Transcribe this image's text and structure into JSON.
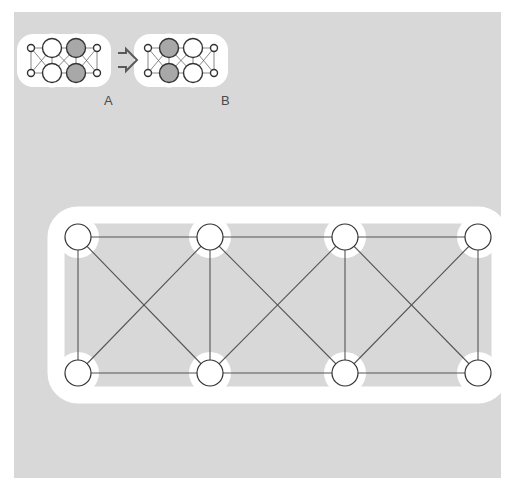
{
  "figure": {
    "background_color": "#d8d8d8",
    "page_color": "#ffffff",
    "halo_color": "#ffffff",
    "edge_color": "#555555",
    "node_stroke_color": "#333333",
    "node_fill_white": "#ffffff",
    "node_fill_gray": "#a8a8a8",
    "caption_color": "#4a4a4a"
  },
  "captions": {
    "left_label": "A",
    "right_label": "B"
  },
  "transform_arrow": {
    "icon": "right-double-arrow-icon",
    "glyph": "⇒"
  },
  "small_graph_a": {
    "title": "A",
    "nodes": [
      {
        "id": "a-l-top",
        "cx": 31,
        "cy": 48,
        "r": 3.5,
        "fill": "#ffffff",
        "size": "small"
      },
      {
        "id": "a-l-bot",
        "cx": 31,
        "cy": 73,
        "r": 3.5,
        "fill": "#ffffff",
        "size": "small"
      },
      {
        "id": "a-m1-top",
        "cx": 52,
        "cy": 48,
        "r": 9.5,
        "fill": "#ffffff",
        "size": "large"
      },
      {
        "id": "a-m1-bot",
        "cx": 52,
        "cy": 73,
        "r": 9.5,
        "fill": "#ffffff",
        "size": "large"
      },
      {
        "id": "a-m2-top",
        "cx": 76,
        "cy": 48,
        "r": 9.5,
        "fill": "#a8a8a8",
        "size": "large"
      },
      {
        "id": "a-m2-bot",
        "cx": 76,
        "cy": 73,
        "r": 9.5,
        "fill": "#a8a8a8",
        "size": "large"
      },
      {
        "id": "a-r-top",
        "cx": 97,
        "cy": 48,
        "r": 3.5,
        "fill": "#ffffff",
        "size": "small"
      },
      {
        "id": "a-r-bot",
        "cx": 97,
        "cy": 73,
        "r": 3.5,
        "fill": "#ffffff",
        "size": "small"
      }
    ],
    "edges": [
      [
        "a-l-top",
        "a-l-bot"
      ],
      [
        "a-l-top",
        "a-m1-top"
      ],
      [
        "a-l-bot",
        "a-m1-bot"
      ],
      [
        "a-l-top",
        "a-m1-bot"
      ],
      [
        "a-l-bot",
        "a-m1-top"
      ],
      [
        "a-m1-top",
        "a-m1-bot"
      ],
      [
        "a-m1-top",
        "a-m2-top"
      ],
      [
        "a-m1-bot",
        "a-m2-bot"
      ],
      [
        "a-m1-top",
        "a-m2-bot"
      ],
      [
        "a-m1-bot",
        "a-m2-top"
      ],
      [
        "a-m2-top",
        "a-m2-bot"
      ],
      [
        "a-m2-top",
        "a-r-top"
      ],
      [
        "a-m2-bot",
        "a-r-bot"
      ],
      [
        "a-m2-top",
        "a-r-bot"
      ],
      [
        "a-m2-bot",
        "a-r-top"
      ],
      [
        "a-r-top",
        "a-r-bot"
      ]
    ]
  },
  "small_graph_b": {
    "title": "B",
    "nodes": [
      {
        "id": "b-l-top",
        "cx": 148,
        "cy": 48,
        "r": 3.5,
        "fill": "#ffffff",
        "size": "small"
      },
      {
        "id": "b-l-bot",
        "cx": 148,
        "cy": 73,
        "r": 3.5,
        "fill": "#ffffff",
        "size": "small"
      },
      {
        "id": "b-m1-top",
        "cx": 169,
        "cy": 48,
        "r": 9.5,
        "fill": "#a8a8a8",
        "size": "large"
      },
      {
        "id": "b-m1-bot",
        "cx": 169,
        "cy": 73,
        "r": 9.5,
        "fill": "#a8a8a8",
        "size": "large"
      },
      {
        "id": "b-m2-top",
        "cx": 193,
        "cy": 48,
        "r": 9.5,
        "fill": "#ffffff",
        "size": "large"
      },
      {
        "id": "b-m2-bot",
        "cx": 193,
        "cy": 73,
        "r": 9.5,
        "fill": "#ffffff",
        "size": "large"
      },
      {
        "id": "b-r-top",
        "cx": 214,
        "cy": 48,
        "r": 3.5,
        "fill": "#ffffff",
        "size": "small"
      },
      {
        "id": "b-r-bot",
        "cx": 214,
        "cy": 73,
        "r": 3.5,
        "fill": "#ffffff",
        "size": "small"
      }
    ],
    "edges": [
      [
        "b-l-top",
        "b-l-bot"
      ],
      [
        "b-l-top",
        "b-m1-top"
      ],
      [
        "b-l-bot",
        "b-m1-bot"
      ],
      [
        "b-l-top",
        "b-m1-bot"
      ],
      [
        "b-l-bot",
        "b-m1-top"
      ],
      [
        "b-m1-top",
        "b-m1-bot"
      ],
      [
        "b-m1-top",
        "b-m2-top"
      ],
      [
        "b-m1-bot",
        "b-m2-bot"
      ],
      [
        "b-m1-top",
        "b-m2-bot"
      ],
      [
        "b-m1-bot",
        "b-m2-top"
      ],
      [
        "b-m2-top",
        "b-m2-bot"
      ],
      [
        "b-m2-top",
        "b-r-top"
      ],
      [
        "b-m2-bot",
        "b-r-bot"
      ],
      [
        "b-m2-top",
        "b-r-bot"
      ],
      [
        "b-m2-bot",
        "b-r-top"
      ],
      [
        "b-r-top",
        "b-r-bot"
      ]
    ]
  },
  "main_graph": {
    "node_radius": 13,
    "nodes": [
      {
        "id": "t1",
        "cx": 78,
        "cy": 237,
        "fill": "#ffffff"
      },
      {
        "id": "t2",
        "cx": 210,
        "cy": 237,
        "fill": "#ffffff"
      },
      {
        "id": "t3",
        "cx": 345,
        "cy": 237,
        "fill": "#ffffff"
      },
      {
        "id": "t4",
        "cx": 478,
        "cy": 237,
        "fill": "#ffffff"
      },
      {
        "id": "b1",
        "cx": 78,
        "cy": 373,
        "fill": "#ffffff"
      },
      {
        "id": "b2",
        "cx": 210,
        "cy": 373,
        "fill": "#ffffff"
      },
      {
        "id": "b3",
        "cx": 345,
        "cy": 373,
        "fill": "#ffffff"
      },
      {
        "id": "b4",
        "cx": 478,
        "cy": 373,
        "fill": "#ffffff"
      }
    ],
    "edges": [
      [
        "t1",
        "t2"
      ],
      [
        "t2",
        "t3"
      ],
      [
        "t3",
        "t4"
      ],
      [
        "b1",
        "b2"
      ],
      [
        "b2",
        "b3"
      ],
      [
        "b3",
        "b4"
      ],
      [
        "t1",
        "b1"
      ],
      [
        "t2",
        "b2"
      ],
      [
        "t3",
        "b3"
      ],
      [
        "t4",
        "b4"
      ],
      [
        "t1",
        "b2"
      ],
      [
        "b1",
        "t2"
      ],
      [
        "t2",
        "b3"
      ],
      [
        "b2",
        "t3"
      ],
      [
        "t3",
        "b4"
      ],
      [
        "b3",
        "t4"
      ]
    ]
  }
}
